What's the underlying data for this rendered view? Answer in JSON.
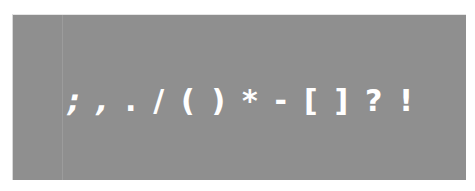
{
  "card": {
    "background": "#8f8f8f",
    "text_color": "#ffffff"
  },
  "glyphs": [
    ";",
    ",",
    ".",
    "/",
    "(",
    ")",
    "*",
    "-",
    "[",
    "]",
    "?",
    "!"
  ],
  "text": "; , . / ( ) * - [ ] ? !"
}
